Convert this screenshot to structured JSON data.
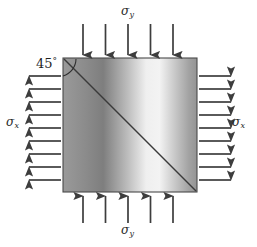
{
  "figure": {
    "name": "biaxial-stress-element-45-degree-plane",
    "width": 257,
    "height": 247,
    "background_color": "#ffffff"
  },
  "element": {
    "x": 63,
    "y": 58,
    "size": 134,
    "border_color": "#4a4a4a",
    "gradient_stops": [
      "#9a9a9a",
      "#7c7c7c",
      "#efefef",
      "#f4f4f4",
      "#a8a8a8",
      "#949494"
    ],
    "diagonal_color": "#3a3a3a"
  },
  "labels": {
    "sigma_symbol": "σ",
    "sigma_y_top": {
      "symbol": "σ",
      "subscript": "y"
    },
    "sigma_y_bottom": {
      "symbol": "σ",
      "subscript": "y"
    },
    "sigma_x_left": {
      "symbol": "σ",
      "subscript": "x"
    },
    "sigma_x_right": {
      "symbol": "σ",
      "subscript": "x"
    },
    "angle": {
      "value": "45",
      "degree": "°"
    }
  },
  "arrows": {
    "color": "#3d3d3d",
    "top": {
      "count": 5,
      "direction": "down",
      "label": "compression",
      "positions": [
        83,
        105.5,
        128,
        150.5,
        173
      ],
      "start_y": 24,
      "end_y": 56
    },
    "bottom": {
      "count": 5,
      "direction": "up",
      "label": "compression",
      "positions": [
        83,
        105.5,
        128,
        150.5,
        173
      ],
      "start_y": 223,
      "end_y": 199
    },
    "left": {
      "count": 9,
      "direction": "left",
      "label": "tension",
      "positions": [
        76,
        89,
        102,
        115,
        128,
        141,
        154,
        167,
        180
      ],
      "start_x": 61,
      "end_x": 26
    },
    "right": {
      "count": 9,
      "direction": "right",
      "label": "tension",
      "positions": [
        76,
        89,
        102,
        115,
        128,
        141,
        154,
        167,
        180
      ],
      "start_x": 199,
      "end_x": 234
    }
  }
}
